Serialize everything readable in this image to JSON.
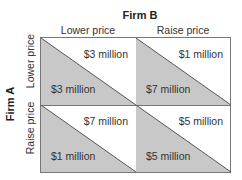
{
  "title": "Firm B",
  "row_player": "Firm A",
  "columns": [
    "Lower price",
    "Raise price"
  ],
  "rows": [
    "Lower price",
    "Raise price"
  ],
  "colors": {
    "shade": "#c8c8c8",
    "line": "#777777",
    "diagonal": "#333333"
  },
  "cells": [
    {
      "row": "Lower price",
      "col": "Lower price",
      "firm_a": "$3 million",
      "firm_b": "$3 million"
    },
    {
      "row": "Lower price",
      "col": "Raise price",
      "firm_a": "$7 million",
      "firm_b": "$1 million"
    },
    {
      "row": "Raise price",
      "col": "Lower price",
      "firm_a": "$1 million",
      "firm_b": "$7 million"
    },
    {
      "row": "Raise price",
      "col": "Raise price",
      "firm_a": "$5 million",
      "firm_b": "$5 million"
    }
  ]
}
